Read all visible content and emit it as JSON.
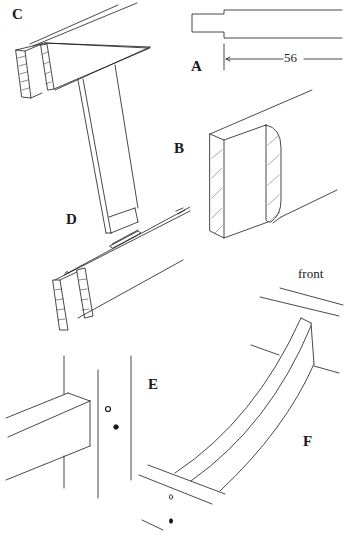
{
  "figure": {
    "type": "woodworking joinery technical drawing",
    "line_color": "#1a1a1a",
    "background": "#ffffff",
    "panels": [
      {
        "id": "A",
        "label": "A",
        "description": "tenon side elevation with dimension",
        "dimension": "56"
      },
      {
        "id": "B",
        "label": "B",
        "description": "rail end with rounded-shoulder tenon, hatched cheeks"
      },
      {
        "id": "C",
        "label": "C",
        "description": "rail with twin tenons and vertical slat"
      },
      {
        "id": "D",
        "label": "D",
        "description": "rail with mortise slot for slat"
      },
      {
        "id": "E",
        "label": "E",
        "description": "rail joining leg with dowel holes"
      },
      {
        "id": "F",
        "label": "F",
        "description": "curved brace between rails",
        "annotation": "front"
      }
    ]
  },
  "labels": {
    "A": "A",
    "B": "B",
    "C": "C",
    "D": "D",
    "E": "E",
    "F": "F",
    "dimension_56": "56",
    "front": "front"
  }
}
